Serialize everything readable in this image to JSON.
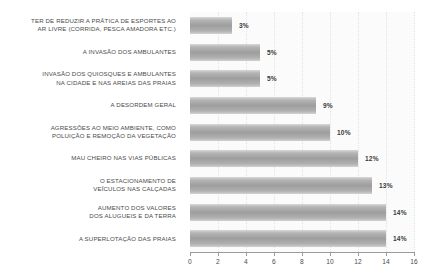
{
  "chart_data": {
    "type": "bar",
    "orientation": "horizontal",
    "title": "",
    "subtitle": "",
    "xlabel": "",
    "ylabel": "",
    "xlim": [
      0,
      16
    ],
    "xticks": [
      0,
      2,
      4,
      6,
      8,
      10,
      12,
      14,
      16
    ],
    "xtick_labels": [
      "0",
      "2",
      "4",
      "6",
      "8",
      "10",
      "12",
      "14",
      "16"
    ],
    "grid": true,
    "grid_axis": "x",
    "legend": false,
    "legend_position": "none",
    "categories": [
      "TER DE REDUZIR A PRÁTICA DE ESPORTES AO\nAR LIVRE (CORRIDA, PESCA AMADORA ETC.)",
      "A INVASÃO DOS  AMBULANTES",
      "INVASÃO DOS QUIOSQUES E AMBULANTES\nNA CIDADE E NAS AREIAS DAS PRAIAS",
      "A DESORDEM GERAL",
      "AGRESSÕES AO MEIO AMBIENTE, COMO\nPOLUIÇÃO E REMOÇÃO DA VEGETAÇÃO",
      "MAU CHEIRO NAS VIAS PÚBLICAS",
      "O ESTACIONAMENTO DE\nVEÍCULOS NAS CALÇADAS",
      "AUMENTO DOS VALORES\nDOS ALUGUEIS E DA TERRA",
      "A SUPERLOTAÇÃO DAS PRAIAS"
    ],
    "values": [
      3,
      5,
      5,
      9,
      10,
      12,
      13,
      14,
      14
    ],
    "value_labels": [
      "3%",
      "5%",
      "5%",
      "9%",
      "10%",
      "12%",
      "13%",
      "14%",
      "14%"
    ],
    "bar_color_dark": "#9e9e9e",
    "bar_color_light": "#d8d8d8",
    "plot_background": "#fbfbfb",
    "axis_color": "#9a9a9a",
    "gridline_color": "#e3e3e3",
    "text_color": "#4a4a4a"
  }
}
